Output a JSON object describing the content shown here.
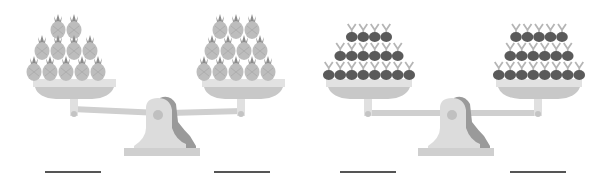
{
  "worksheet": {
    "type": "compare-quantities-balance-scales",
    "colors": {
      "pan_light": "#e2e2e2",
      "pan_dark": "#c8c8c8",
      "beam": "#cfcfcf",
      "base_light": "#dcdcdc",
      "base_dark": "#9a9a9a",
      "pineapple": "#bdbdbd",
      "pineapple_crown": "#8c8c8c",
      "cherry": "#5a5a5a",
      "cherry_stem": "#b5b5b5",
      "answer_line": "#555555"
    },
    "scales": [
      {
        "id": "scale-1",
        "item": "pineapple",
        "left_pan": {
          "rows": [
            2,
            4,
            5
          ],
          "count": 11
        },
        "right_pan": {
          "rows": [
            3,
            4,
            5
          ],
          "count": 12
        },
        "answer_blanks": [
          "",
          ""
        ]
      },
      {
        "id": "scale-2",
        "item": "cherry",
        "left_pan": {
          "rows": [
            4,
            6,
            8
          ],
          "count": 18
        },
        "right_pan": {
          "rows": [
            5,
            6,
            8
          ],
          "count": 19
        },
        "answer_blanks": [
          "",
          ""
        ]
      }
    ]
  }
}
